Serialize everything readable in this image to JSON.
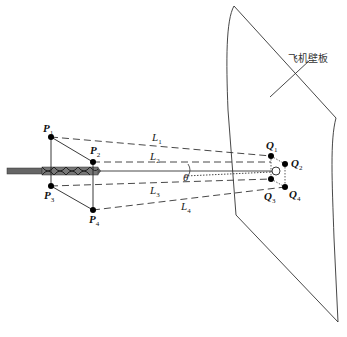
{
  "figure": {
    "panel_label": "飞机壁板",
    "points_P": [
      {
        "id": "P1",
        "letter": "P",
        "sub": "1"
      },
      {
        "id": "P2",
        "letter": "P",
        "sub": "2"
      },
      {
        "id": "P3",
        "letter": "P",
        "sub": "3"
      },
      {
        "id": "P4",
        "letter": "P",
        "sub": "4"
      }
    ],
    "points_Q": [
      {
        "id": "Q1",
        "letter": "Q",
        "sub": "1"
      },
      {
        "id": "Q2",
        "letter": "Q",
        "sub": "2"
      },
      {
        "id": "Q3",
        "letter": "Q",
        "sub": "3"
      },
      {
        "id": "Q4",
        "letter": "Q",
        "sub": "4"
      }
    ],
    "distances": [
      {
        "id": "L1",
        "letter": "L",
        "sub": "1"
      },
      {
        "id": "L2",
        "letter": "L",
        "sub": "2"
      },
      {
        "id": "L3",
        "letter": "L",
        "sub": "3"
      },
      {
        "id": "L4",
        "letter": "L",
        "sub": "4"
      }
    ],
    "angle_label": "θ",
    "colors": {
      "line": "#333333",
      "point": "#000000",
      "drill": "#555555"
    }
  }
}
